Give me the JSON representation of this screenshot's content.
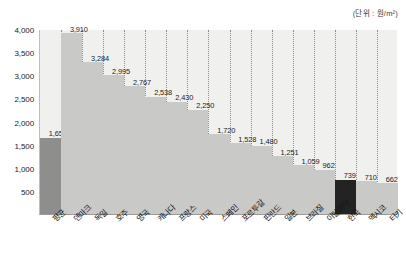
{
  "unit_note": "(단위 : 원/m²)",
  "chart_data": {
    "type": "bar",
    "title": "",
    "subtitle": "",
    "xlabel": "",
    "ylabel": "",
    "unit": "원/m²",
    "ylim": [
      0,
      4000
    ],
    "grid": "vertical-dotted",
    "legend": "none",
    "categories": [
      "평균",
      "덴마크",
      "독일",
      "호주",
      "영국",
      "캐나다",
      "프랑스",
      "미국",
      "스페인",
      "포르투갈",
      "핀란드",
      "일본",
      "브라질",
      "이탈리아",
      "한국",
      "멕시코",
      "터키"
    ],
    "values": [
      1651,
      3910,
      3284,
      2995,
      2767,
      2538,
      2430,
      2250,
      1720,
      1528,
      1480,
      1251,
      1059,
      962,
      739,
      710,
      662
    ],
    "value_labels": [
      "1,651",
      "3,910",
      "3,284",
      "2,995",
      "2,767",
      "2,538",
      "2,430",
      "2,250",
      "1,720",
      "1,528",
      "1,480",
      "1,251",
      "1,059",
      "962",
      "739",
      "710",
      "662"
    ],
    "bar_tones": [
      "average",
      "normal",
      "normal",
      "normal",
      "normal",
      "normal",
      "normal",
      "normal",
      "normal",
      "normal",
      "normal",
      "normal",
      "normal",
      "normal",
      "highlight",
      "normal",
      "normal"
    ],
    "y_ticks": [
      4000,
      3500,
      3000,
      2500,
      2000,
      1500,
      1000,
      500
    ],
    "y_tick_labels": [
      "4,000",
      "3,500",
      "3,000",
      "2,500",
      "2,000",
      "1,500",
      "1,000",
      "500"
    ],
    "colors": {
      "bar_normal": "#c9c9c7",
      "bar_average": "#8e8e8c",
      "bar_highlight": "#232323",
      "plot_background": "#f0f0ee",
      "gridline": "#8e8e8e",
      "text": "#1c1c1c"
    }
  }
}
